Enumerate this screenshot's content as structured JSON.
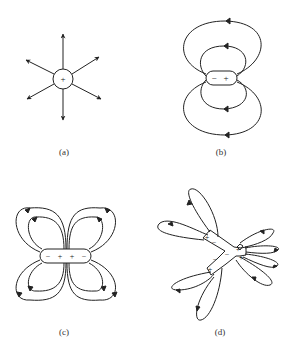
{
  "figure": {
    "panels": [
      {
        "id": "a",
        "label": "(a)",
        "name": "monopole",
        "charges": [
          "+"
        ]
      },
      {
        "id": "b",
        "label": "(b)",
        "name": "dipole",
        "charges": [
          "−",
          "+"
        ]
      },
      {
        "id": "c",
        "label": "(c)",
        "name": "quadrupole",
        "charges": [
          "−",
          "+",
          "+",
          "−"
        ]
      },
      {
        "id": "d",
        "label": "(d)",
        "name": "multipole",
        "charges": [
          "+",
          "−",
          "+",
          "−",
          "−",
          "+",
          "+"
        ]
      }
    ]
  },
  "colors": {
    "line": "#222222",
    "background": "#ffffff"
  }
}
